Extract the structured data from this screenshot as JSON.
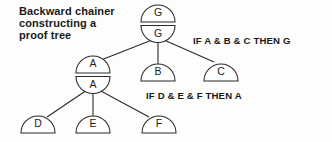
{
  "caption": {
    "lines": [
      "Backward chainer",
      "constructing a",
      "proof tree"
    ]
  },
  "rules": {
    "top": "IF A & B & C THEN G",
    "bottom": "IF D & E & F THEN A"
  },
  "nodes": {
    "goal_top": "G",
    "goal_bottom": "G",
    "sub_top": "A",
    "sub_bottom": "A",
    "leaf_b": "B",
    "leaf_c": "C",
    "leaf_d": "D",
    "leaf_e": "E",
    "leaf_f": "F"
  },
  "style": {
    "ink": "#2b2b2b",
    "paper": "#fdfdfc"
  }
}
